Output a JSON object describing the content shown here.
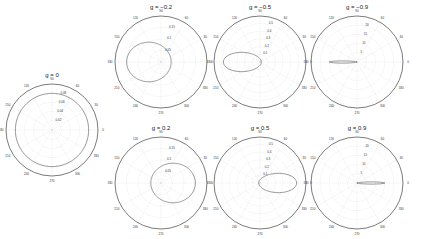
{
  "chart_data": [
    {
      "type": "polar-line",
      "title": "g = 0",
      "g": 0,
      "rticks": [
        "0.02",
        "0.04",
        "0.06",
        "0.08"
      ],
      "rmax": 0.08,
      "theta_ticks": [
        "0",
        "30",
        "60",
        "90",
        "120",
        "150",
        "180",
        "210",
        "240",
        "270",
        "300",
        "330"
      ],
      "grid": true
    },
    {
      "type": "polar-line",
      "title": "g = −0.2",
      "g": -0.2,
      "rticks": [
        "0.05",
        "0.1",
        "0.15"
      ],
      "rmax": 0.15,
      "theta_ticks": [
        "0",
        "30",
        "60",
        "90",
        "120",
        "150",
        "180",
        "210",
        "240",
        "270",
        "300",
        "330"
      ],
      "grid": true
    },
    {
      "type": "polar-line",
      "title": "g = −0.5",
      "g": -0.5,
      "rticks": [
        "0.1",
        "0.2",
        "0.3",
        "0.4",
        "0.5"
      ],
      "rmax": 0.5,
      "theta_ticks": [
        "0",
        "30",
        "60",
        "90",
        "120",
        "150",
        "180",
        "210",
        "240",
        "270",
        "300",
        "330"
      ],
      "grid": true
    },
    {
      "type": "polar-line",
      "title": "g = −0.9",
      "g": -0.9,
      "rticks": [
        "5",
        "10",
        "15",
        "20"
      ],
      "rmax": 20,
      "theta_ticks": [
        "0",
        "30",
        "60",
        "90",
        "120",
        "150",
        "180",
        "210",
        "240",
        "270",
        "300",
        "330"
      ],
      "grid": true
    },
    {
      "type": "polar-line",
      "title": "g = 0.2",
      "g": 0.2,
      "rticks": [
        "0.05",
        "0.1",
        "0.15"
      ],
      "rmax": 0.15,
      "theta_ticks": [
        "0",
        "30",
        "60",
        "90",
        "120",
        "150",
        "180",
        "210",
        "240",
        "270",
        "300",
        "330"
      ],
      "grid": true
    },
    {
      "type": "polar-line",
      "title": "g = 0.5",
      "g": 0.5,
      "rticks": [
        "0.1",
        "0.2",
        "0.3",
        "0.4",
        "0.5"
      ],
      "rmax": 0.5,
      "theta_ticks": [
        "0",
        "30",
        "60",
        "90",
        "120",
        "150",
        "180",
        "210",
        "240",
        "270",
        "300",
        "330"
      ],
      "grid": true
    },
    {
      "type": "polar-line",
      "title": "g = 0.9",
      "g": 0.9,
      "rticks": [
        "5",
        "10",
        "15",
        "20"
      ],
      "rmax": 20,
      "theta_ticks": [
        "0",
        "30",
        "60",
        "90",
        "120",
        "150",
        "180",
        "210",
        "240",
        "270",
        "300",
        "330"
      ],
      "grid": true
    }
  ],
  "panels": [
    {
      "title": "g = 0",
      "cx": 52,
      "cy": 130,
      "r": 46
    },
    {
      "title": "g = −0.2",
      "cx": 161,
      "cy": 62,
      "r": 46
    },
    {
      "title": "g = −0.5",
      "cx": 260,
      "cy": 62,
      "r": 46
    },
    {
      "title": "g = −0.9",
      "cx": 357,
      "cy": 62,
      "r": 46
    },
    {
      "title": "g = 0.2",
      "cx": 161,
      "cy": 183,
      "r": 46
    },
    {
      "title": "g = 0.5",
      "cx": 260,
      "cy": 183,
      "r": 46
    },
    {
      "title": "g = 0.9",
      "cx": 357,
      "cy": 183,
      "r": 46
    }
  ]
}
